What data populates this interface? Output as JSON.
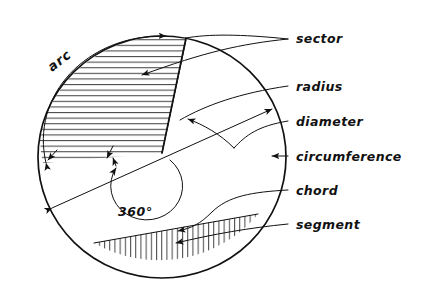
{
  "figure": {
    "background_color": "#ffffff",
    "ink_color": "#111111",
    "labels": {
      "sector": "sector",
      "radius": "radius",
      "diameter": "diameter",
      "circumference": "circumference",
      "chord": "chord",
      "segment": "segment",
      "arc": "arc",
      "angle": "360°"
    },
    "parts": [
      {
        "id": "sector",
        "label": "sector",
        "description": "horizontally hatched wedge of the circle",
        "hatch": "horizontal",
        "label_x": 296,
        "label_y": 38
      },
      {
        "id": "radius",
        "label": "radius",
        "description": "line from centre to circumference",
        "hatch": "none",
        "label_x": 296,
        "label_y": 86
      },
      {
        "id": "diameter",
        "label": "diameter",
        "description": "double headed arrow across the circle through the centre",
        "hatch": "none",
        "label_x": 296,
        "label_y": 121
      },
      {
        "id": "circumference",
        "label": "circumference",
        "description": "outer boundary of the circle",
        "hatch": "none",
        "label_x": 296,
        "label_y": 156
      },
      {
        "id": "chord",
        "label": "chord",
        "description": "straight line joining two points on the circumference",
        "hatch": "none",
        "label_x": 296,
        "label_y": 190
      },
      {
        "id": "segment",
        "label": "segment",
        "description": "vertically hatched area cut off by the chord",
        "hatch": "vertical",
        "label_x": 296,
        "label_y": 224
      },
      {
        "id": "arc",
        "label": "arc",
        "description": "curved double headed arrow outside the circle",
        "hatch": "none",
        "label_x": 70,
        "label_y": 62
      },
      {
        "id": "angle",
        "label": "360°",
        "description": "full turn marked by the small circle at the centre",
        "hatch": "none",
        "label_x": 138,
        "label_y": 212
      }
    ]
  }
}
